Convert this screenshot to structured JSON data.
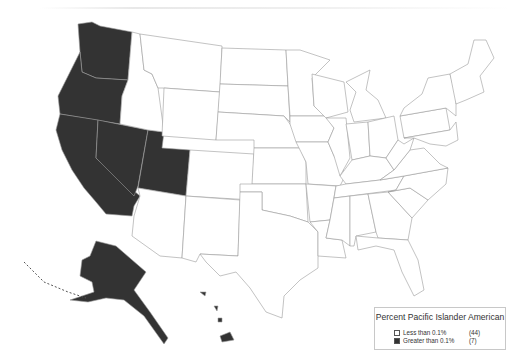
{
  "legend": {
    "title": "Percent Pacific Islander American",
    "items": [
      {
        "label": "Less than 0.1%",
        "count": "(44)",
        "color": "#ffffff"
      },
      {
        "label": "Greater than 0.1%",
        "count": "(7)",
        "color": "#333333"
      }
    ]
  },
  "map": {
    "colors": {
      "low": "#ffffff",
      "high": "#333333",
      "border": "#9a9a9a"
    },
    "shaded_states": [
      "Washington",
      "Oregon",
      "California",
      "Nevada",
      "Utah",
      "Alaska",
      "Hawaii"
    ]
  }
}
